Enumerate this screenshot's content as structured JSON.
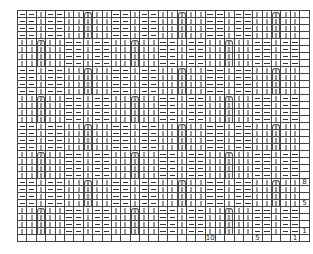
{
  "chart": {
    "title": "",
    "type": "knitting-chart",
    "columns": 30,
    "rows": 32,
    "symbols": {
      "knit": "|",
      "purl": "—",
      "cable": "∩"
    },
    "pattern_repeat": {
      "width": 10,
      "height": 8,
      "row_A": [
        "purl",
        "purl",
        "knit",
        "purl",
        "purl",
        "knit",
        "knit",
        "cable",
        "knit",
        "knit"
      ],
      "row_B": [
        "knit",
        "knit",
        "cable",
        "knit",
        "knit",
        "purl",
        "purl",
        "knit",
        "purl",
        "purl"
      ],
      "block_order_from_top": [
        "A",
        "B",
        "A",
        "B",
        "A",
        "B",
        "A",
        "B"
      ]
    },
    "row_labels": [
      {
        "row_from_bottom": 8,
        "text": "8"
      },
      {
        "row_from_bottom": 5,
        "text": "5"
      },
      {
        "row_from_bottom": 1,
        "text": "1"
      }
    ],
    "column_labels": [
      {
        "col_from_right": 10,
        "text": "10"
      },
      {
        "col_from_right": 5,
        "text": "5"
      },
      {
        "col_from_right": 1,
        "text": "1"
      }
    ],
    "line_color": "#444444",
    "background": "#ffffff"
  }
}
